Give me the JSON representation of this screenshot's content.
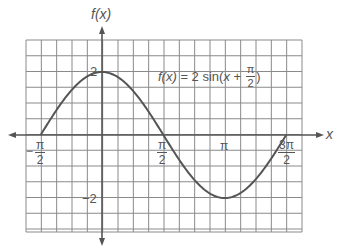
{
  "chart_data": {
    "type": "line",
    "function": "2*sin(x + pi/2)",
    "xlabel": "x",
    "ylabel": "f(x)",
    "xlim": [
      -1.5708,
      4.7124
    ],
    "ylim": [
      -2,
      2
    ],
    "grid": true,
    "x_ticks": [
      {
        "value": -1.5708,
        "label_num": "π",
        "label_den": "2",
        "sign": "−"
      },
      {
        "value": 1.5708,
        "label_num": "π",
        "label_den": "2",
        "sign": ""
      },
      {
        "value": 3.1416,
        "label": "π"
      },
      {
        "value": 4.7124,
        "label_num": "3π",
        "label_den": "2",
        "sign": ""
      }
    ],
    "y_ticks": [
      {
        "value": 2,
        "label": "2"
      },
      {
        "value": -2,
        "label": "−2"
      }
    ],
    "key_points": [
      {
        "x": -1.5708,
        "y": 0
      },
      {
        "x": 0,
        "y": 2
      },
      {
        "x": 1.5708,
        "y": 0
      },
      {
        "x": 3.1416,
        "y": -2
      },
      {
        "x": 4.7124,
        "y": 0
      }
    ],
    "series": [
      {
        "name": "f(x) = 2sin(x + π/2)",
        "color": "#555555"
      }
    ]
  },
  "labels": {
    "y_axis": "f(x)",
    "x_axis": "x",
    "y_tick_top": "2",
    "y_tick_bottom": "−2",
    "x_tick_neg_half_pi_sign": "−",
    "x_tick_neg_half_pi_num": "π",
    "x_tick_neg_half_pi_den": "2",
    "x_tick_half_pi_num": "π",
    "x_tick_half_pi_den": "2",
    "x_tick_pi": "π",
    "x_tick_three_half_pi_num": "3π",
    "x_tick_three_half_pi_den": "2",
    "formula_lhs": "f(x)",
    "formula_eq": " = 2 sin(",
    "formula_x": "x",
    "formula_plus": " + ",
    "formula_frac_num": "π",
    "formula_frac_den": "2",
    "formula_close": ")"
  },
  "colors": {
    "grid": "#8a8a8a",
    "axis": "#555555",
    "curve": "#555555",
    "text": "#555555"
  }
}
